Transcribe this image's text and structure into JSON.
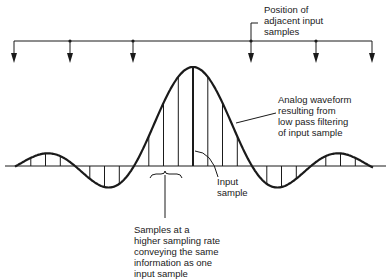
{
  "figure": {
    "labels": {
      "adjacent_positions": "Position of\nadjacent input\nsamples",
      "analog_waveform": "Analog waveform\nresulting from\nlow pass filtering\nof input sample",
      "input_sample": "Input\nsample",
      "higher_rate_samples": "Samples at a\nhigher sampling rate\nconveying the same\ninformation as one\ninput sample"
    },
    "adjacent_input_sample_count": 6,
    "input_sample_index": 0,
    "interpolation_ratio": 4,
    "waveform": "sinc",
    "colors": {
      "ink": "#1a1a1a",
      "background": "#ffffff"
    }
  }
}
